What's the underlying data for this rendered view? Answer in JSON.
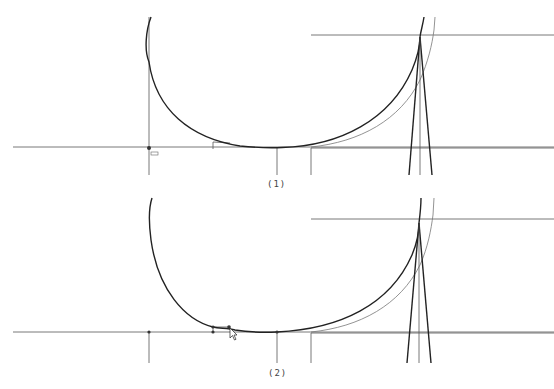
{
  "figure": {
    "type": "hull-section-construction-drawing",
    "panels": [
      {
        "id": "panel-1",
        "caption": "(1)",
        "description": "Hull section curve with baseline, centerline, chine step and frame triangle; cursor/marker at origin",
        "marker_label": "ccc"
      },
      {
        "id": "panel-2",
        "caption": "(2)",
        "description": "Same hull section with control points shown and mouse cursor dragging a point near the keel"
      }
    ]
  },
  "colors": {
    "background": "#ffffff",
    "line_dark": "#222222",
    "line_thin": "#555555",
    "line_gray": "#777777"
  }
}
